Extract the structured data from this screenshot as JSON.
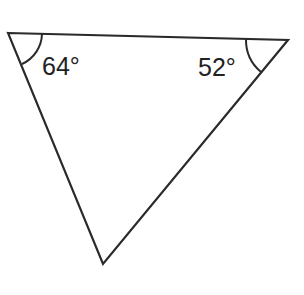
{
  "diagram": {
    "type": "triangle",
    "vertices": {
      "top_left": [
        8,
        33
      ],
      "top_right": [
        288,
        40
      ],
      "bottom": [
        103,
        264
      ]
    },
    "angles": [
      {
        "vertex": "top_left",
        "label": "64°"
      },
      {
        "vertex": "top_right",
        "label": "52°"
      }
    ],
    "stroke_color": "#2a2a2a",
    "background": "#ffffff"
  }
}
